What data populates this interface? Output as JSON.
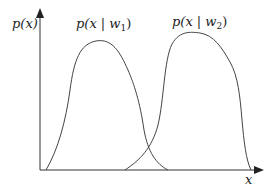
{
  "diagram": {
    "type": "class-conditional-densities",
    "y_axis_label": "p(x)",
    "x_axis_label": "x",
    "curves": [
      {
        "name": "class-1",
        "label_main": "p(x | w",
        "label_sub": "1",
        "label_close": ")"
      },
      {
        "name": "class-2",
        "label_main": "p(x | w",
        "label_sub": "2",
        "label_close": ")"
      }
    ],
    "colors": {
      "line": "#444444",
      "axis": "#333333",
      "text": "#222222",
      "background": "#ffffff"
    }
  }
}
